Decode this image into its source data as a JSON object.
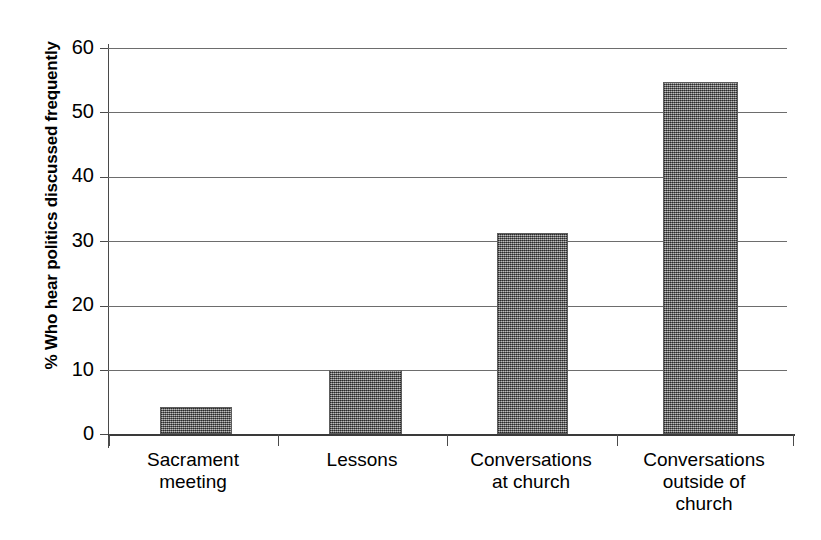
{
  "chart_data": {
    "type": "bar",
    "title": "",
    "xlabel": "",
    "ylabel": "% Who hear politics discussed frequently",
    "ylim": [
      0,
      60
    ],
    "yticks": [
      0,
      10,
      20,
      30,
      40,
      50,
      60
    ],
    "grid": true,
    "legend": null,
    "categories": [
      "Sacrament meeting",
      "Lessons",
      "Conversations at church",
      "Conversations outside of church"
    ],
    "category_lines": [
      [
        "Sacrament",
        "meeting"
      ],
      [
        "Lessons"
      ],
      [
        "Conversations",
        "at church"
      ],
      [
        "Conversations",
        "outside of",
        "church"
      ]
    ],
    "values": [
      4.2,
      10.0,
      31.2,
      54.7
    ],
    "bar_color": "#7a7a7a",
    "axis_color": "#3a3a3a",
    "gridline_color": "#6d6d6d"
  },
  "axis": {
    "tick_labels": [
      "60",
      "50",
      "40",
      "30",
      "20",
      "10",
      "0"
    ]
  }
}
